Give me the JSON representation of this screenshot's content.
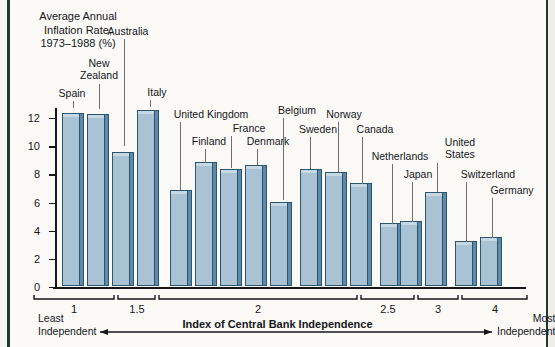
{
  "chart_data": {
    "type": "bar",
    "title": "Average Annual\nInflation Rate,\n1973–1988 (%)",
    "ylabel": "Average Annual Inflation Rate, 1973-1988 (%)",
    "xlabel": "Index of Central Bank Independence",
    "ylim": [
      0,
      13
    ],
    "ytick_labels": [
      "0",
      "2",
      "4",
      "6",
      "8",
      "10",
      "12"
    ],
    "ytick_values": [
      0,
      2,
      4,
      6,
      8,
      10,
      12
    ],
    "xtick_labels": [
      "1",
      "1.5",
      "2",
      "2.5",
      "3",
      "4"
    ],
    "xtick_values": [
      1,
      1.5,
      2,
      2.5,
      3,
      4
    ],
    "grid": false,
    "legend": "none",
    "categories": [
      "Spain",
      "New Zealand",
      "Australia",
      "Italy",
      "United Kingdom",
      "Finland",
      "France",
      "Denmark",
      "Belgium",
      "Sweden",
      "Norway",
      "Canada",
      "Netherlands",
      "Japan",
      "United States",
      "Switzerland",
      "Germany"
    ],
    "values": [
      12.3,
      12.2,
      9.5,
      12.5,
      6.8,
      8.8,
      8.3,
      8.6,
      6.0,
      8.3,
      8.1,
      7.3,
      4.5,
      4.6,
      6.7,
      3.2,
      3.5
    ],
    "annotations": {
      "axis_caption": "Index of Central Bank Independence",
      "left_end": "Least\nIndependent",
      "right_end": "Most\nIndependent"
    }
  },
  "colors": {
    "bar_face": "#a9c3d4",
    "bar_side": "#5d8aa8",
    "bar_outline": "#2d5570",
    "axis": "#14161a",
    "background": "#fbfaf7",
    "frame": "#1d3a30"
  },
  "axis_title": "Average Annual\nInflation Rate,\n1973–1988 (%)",
  "y_labels": {
    "t0": "0",
    "t2": "2",
    "t4": "4",
    "t6": "6",
    "t8": "8",
    "t10": "10",
    "t12": "12"
  },
  "country_labels": {
    "spain": "Spain",
    "new_zealand": "New\nZealand",
    "australia": "Australia",
    "italy": "Italy",
    "united_kingdom": "United Kingdom",
    "finland": "Finland",
    "france": "France",
    "denmark": "Denmark",
    "belgium": "Belgium",
    "sweden": "Sweden",
    "norway": "Norway",
    "canada": "Canada",
    "netherlands": "Netherlands",
    "japan": "Japan",
    "united_states": "United\nStates",
    "switzerland": "Switzerland",
    "germany": "Germany"
  },
  "x_labels": {
    "x1": "1",
    "x15": "1.5",
    "x2": "2",
    "x25": "2.5",
    "x3": "3",
    "x4": "4"
  },
  "caption": "Index of Central Bank Independence",
  "end_labels": {
    "least": "Least\nIndependent",
    "most": "Most\nIndependent"
  }
}
